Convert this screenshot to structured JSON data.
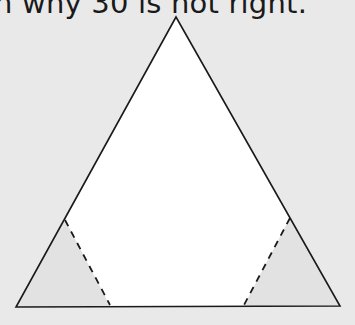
{
  "caption": {
    "text": "n why 30 is not right."
  },
  "figure": {
    "shape": "triangle-with-two-cut-corners",
    "vertices": {
      "apex": [
        176,
        17
      ],
      "bottom_left": [
        16,
        307
      ],
      "bottom_right": [
        340,
        306
      ]
    },
    "cuts": [
      {
        "name": "left-cut",
        "from": [
          65,
          220
        ],
        "to": [
          110,
          305
        ],
        "style": "dashed"
      },
      {
        "name": "right-cut",
        "from": [
          290,
          218
        ],
        "to": [
          244,
          305
        ],
        "style": "dashed"
      }
    ],
    "colors": {
      "background": "#e9e9e9",
      "interior": "#ffffff",
      "corner_shade": "#e2e2e2",
      "stroke": "#1a1a1a"
    }
  }
}
